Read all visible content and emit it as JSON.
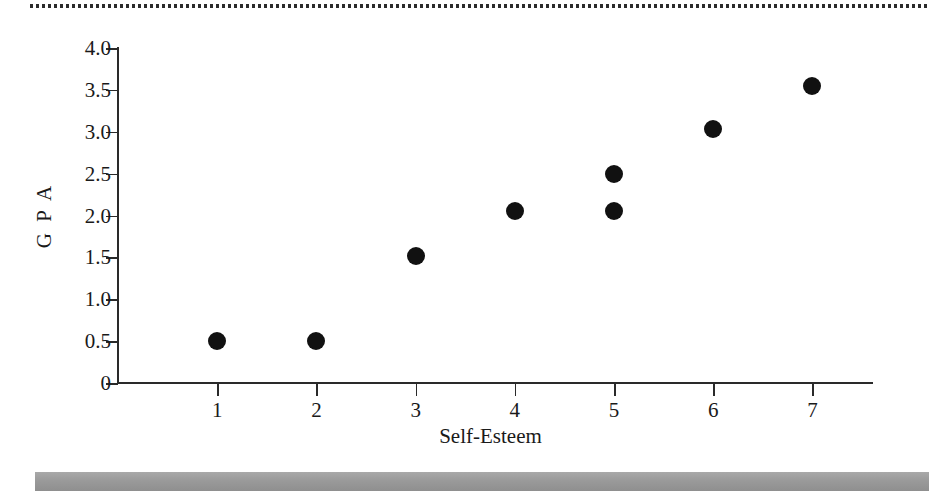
{
  "figure": {
    "background_color": "#ffffff",
    "marker_color": "#111111",
    "axis_color": "#2a2a2a",
    "band_color": "#9d9d9d",
    "top_rule": "dotted-rule",
    "bottom_band": "grey-band"
  },
  "chart_data": {
    "type": "scatter",
    "title": "",
    "xlabel": "Self-Esteem",
    "ylabel": "G P A",
    "xlim": [
      0,
      7.6
    ],
    "ylim": [
      0,
      4.0
    ],
    "grid": false,
    "legend": null,
    "xticks": [
      "1",
      "2",
      "3",
      "4",
      "5",
      "6",
      "7"
    ],
    "xtick_values": [
      1,
      2,
      3,
      4,
      5,
      6,
      7
    ],
    "yticks": [
      "0",
      "0.5",
      "1.0",
      "1.5",
      "2.0",
      "2.5",
      "3.0",
      "3.5",
      "4.0"
    ],
    "ytick_values": [
      0,
      0.5,
      1.0,
      1.5,
      2.0,
      2.5,
      3.0,
      3.5,
      4.0
    ],
    "points": [
      {
        "x": 1,
        "y": 0.5
      },
      {
        "x": 2,
        "y": 0.5
      },
      {
        "x": 3,
        "y": 1.52
      },
      {
        "x": 4,
        "y": 2.05
      },
      {
        "x": 5,
        "y": 2.5
      },
      {
        "x": 5,
        "y": 2.05
      },
      {
        "x": 6,
        "y": 3.03
      },
      {
        "x": 7,
        "y": 3.55
      }
    ]
  }
}
